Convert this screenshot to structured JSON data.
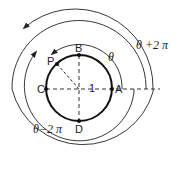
{
  "diagram": {
    "points": {
      "A": "A",
      "B": "B",
      "C": "C",
      "D": "D",
      "P": "P"
    },
    "radius_label": "1",
    "angle_labels": {
      "theta": "θ",
      "theta_plus": "θ +2 π",
      "theta_minus": "θ−2 π"
    },
    "colors": {
      "stroke": "#222222",
      "background": "#ffffff"
    }
  }
}
